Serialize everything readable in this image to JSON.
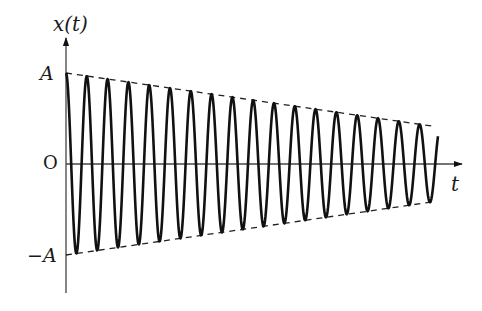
{
  "diagram": {
    "type": "damped-oscillation",
    "labels": {
      "y_axis": "x(t)",
      "x_axis": "t",
      "amplitude_top": "A",
      "origin": "O",
      "amplitude_bottom": "−A"
    },
    "styles": {
      "curve_color": "#111111",
      "axis_color": "#444444",
      "envelope_color": "#222222"
    },
    "geometry": {
      "origin": [
        66,
        164
      ],
      "y_axis_top": 38,
      "y_axis_bottom": 293,
      "x_axis_end": 462,
      "amplitude_start_px": 91,
      "envelope_end_x": 435,
      "amplitude_end_px": 37.5,
      "curve_end_x": 438,
      "period_px": 20.8
    },
    "components": [
      "vertical axis x(t) with arrow",
      "horizontal axis t with arrow",
      "upper dashed envelope from A",
      "lower dashed envelope from −A",
      "oscillating curve starting at A with decaying amplitude (~18 cycles)"
    ]
  }
}
